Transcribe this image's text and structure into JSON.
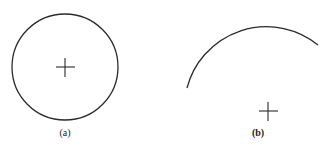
{
  "figures": [
    {
      "id": "a",
      "label": "(a)",
      "shape": "full-circle",
      "center": [
        65,
        67
      ],
      "radius": 53,
      "center_mark": "cross"
    },
    {
      "id": "b",
      "label": "(b)",
      "shape": "arc",
      "center": [
        268,
        111
      ],
      "radius": 82,
      "arc_start": [
        187,
        88
      ],
      "arc_end": [
        318,
        45
      ],
      "center_mark": "cross"
    }
  ],
  "colors": {
    "stroke": "#2a2a2a",
    "background": "#ffffff"
  }
}
